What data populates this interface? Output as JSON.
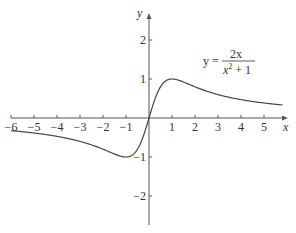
{
  "chart_data": {
    "type": "line",
    "title": "",
    "xlabel": "x",
    "ylabel": "y",
    "xlim": [
      -6,
      5.8
    ],
    "ylim": [
      -2.7,
      2.8
    ],
    "grid": false,
    "x_ticks": [
      -6,
      -5,
      -4,
      -3,
      -2,
      -1,
      1,
      2,
      3,
      4,
      5
    ],
    "x_tick_labels": [
      "−6",
      "−5",
      "−4",
      "−3",
      "−2",
      "−1",
      "1",
      "2",
      "3",
      "4",
      "5"
    ],
    "y_ticks": [
      2,
      1,
      -1,
      -2
    ],
    "y_tick_labels": [
      "2",
      "1",
      "−1",
      "−2"
    ],
    "series": [
      {
        "name": "y = 2x/(x²+1)",
        "function": "2x/(x^2+1)",
        "x": [
          -6,
          -5,
          -4,
          -3,
          -2,
          -1,
          -0.5,
          0,
          0.5,
          1,
          2,
          3,
          4,
          5,
          5.8
        ],
        "values": [
          -0.324,
          -0.385,
          -0.471,
          -0.6,
          -0.8,
          -1.0,
          -0.8,
          0,
          0.8,
          1.0,
          0.8,
          0.6,
          0.471,
          0.385,
          0.335
        ]
      }
    ],
    "annotations": [
      {
        "text": "y = 2x / (x² + 1)",
        "position": "upper right"
      }
    ]
  },
  "equation": {
    "lhs": "y =",
    "numerator": "2x",
    "denominator_base": "x",
    "denominator_exp": "2",
    "denominator_rest": " + 1"
  },
  "axes": {
    "x_label": "x",
    "y_label": "y"
  }
}
